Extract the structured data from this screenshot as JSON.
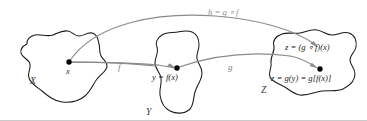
{
  "diagram": {
    "title_label": "h = g ∘ f",
    "sets": [
      {
        "name": "X",
        "label": "X"
      },
      {
        "name": "Y",
        "label": "Y"
      },
      {
        "name": "Z",
        "label": "Z"
      }
    ],
    "points": [
      {
        "name": "x",
        "label": "x"
      },
      {
        "name": "y",
        "label": "y = f(x)"
      },
      {
        "name": "z-composite",
        "label": "z = (g ∘ f)(x)"
      },
      {
        "name": "z-expanded",
        "label": "z = g(y) = g[f(x)]"
      }
    ],
    "maps": [
      {
        "name": "f",
        "label": "f"
      },
      {
        "name": "g",
        "label": "g"
      },
      {
        "name": "h",
        "label": "h = g ∘ f"
      }
    ],
    "colors": {
      "blob_stroke": "#1a1a1a",
      "arrow_stroke": "#8b8b8b",
      "point_fill": "#000000",
      "text_fill": "#2b2b2b",
      "background": "#ffffff",
      "frame": "#c9c9c9"
    }
  }
}
